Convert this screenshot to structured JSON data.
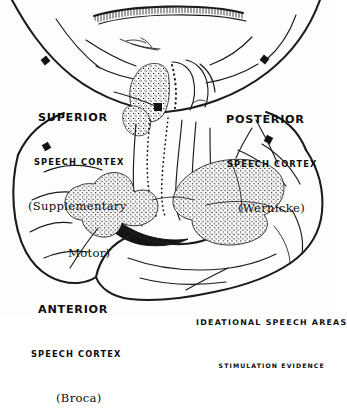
{
  "figure": {
    "title": "Ideational Speech Areas",
    "ink_color": "#1b1b1b",
    "background_color": "#fdfdfb"
  },
  "labels": {
    "superior": {
      "line1": "SUPERIOR",
      "line2": "SPEECH CORTEX",
      "line3": "(Supplementary",
      "line4": "Motor)"
    },
    "posterior": {
      "line1": "POSTERIOR",
      "line2": "SPEECH CORTEX",
      "line3": "(Wernicke)"
    },
    "anterior": {
      "line1": "ANTERIOR",
      "line2": "SPEECH CORTEX",
      "line3": "(Broca)"
    }
  },
  "caption": {
    "line1": "IDEATIONAL SPEECH AREAS",
    "line2": "STIMULATION EVIDENCE"
  }
}
